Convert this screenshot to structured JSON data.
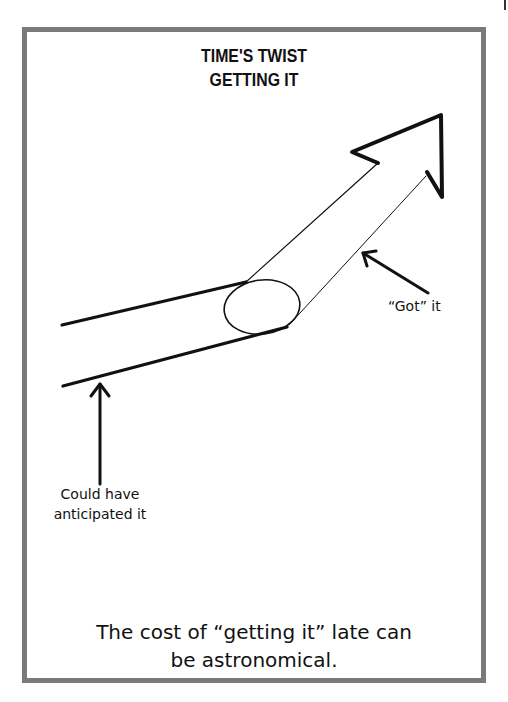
{
  "title": {
    "line1": "TIME'S TWIST",
    "line2": "GETTING IT"
  },
  "labels": {
    "got_it": "“Got” it",
    "could_have": "Could have anticipated it"
  },
  "caption": {
    "line1": "The cost of “getting it” late can",
    "line2": "be astronomical."
  },
  "colors": {
    "frame": "#7a7a7a",
    "ink": "#111111",
    "background": "#ffffff"
  },
  "diagram": {
    "elements": [
      {
        "name": "rising-arrow",
        "description": "Tube bending upward into a large arrow pointing up-right"
      },
      {
        "name": "got-it-pointer",
        "points_to": "upper tube segment"
      },
      {
        "name": "could-have-pointer",
        "points_to": "lower flat tube segment"
      }
    ]
  }
}
